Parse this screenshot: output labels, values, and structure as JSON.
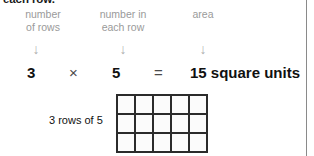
{
  "document": {
    "clipped_sentence": "each row.",
    "captions": [
      {
        "line1": "number",
        "line2": "of rows"
      },
      {
        "line1": "number in",
        "line2": "each row"
      },
      {
        "line1": "area",
        "line2": ""
      }
    ],
    "arrow_glyph": "↓",
    "equation": {
      "factor1": "3",
      "operator_multiply": "×",
      "factor2": "5",
      "operator_equals": "=",
      "result": "15 square units"
    },
    "grid": {
      "label": "3 rows of 5",
      "rows": 3,
      "columns": 5,
      "total_cells": 15,
      "cell_fill_color": "#fbfbfb",
      "line_color": "#2b2b2b"
    },
    "colors": {
      "caption_gray": "#9a9a9a",
      "arrow_gray": "#b0b0b0",
      "text_black": "#111111",
      "rule_gray": "#8a8a8a"
    }
  }
}
